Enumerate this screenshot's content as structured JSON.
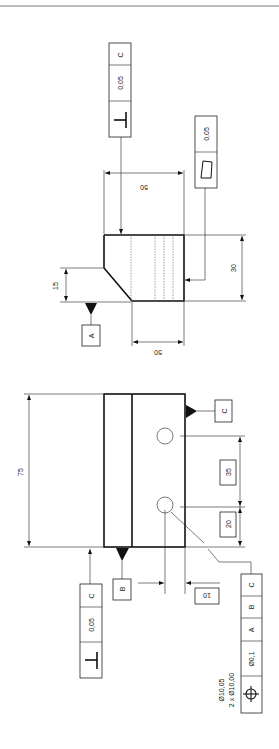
{
  "drawing": {
    "type": "engineering-drawing-gdt",
    "orientation": "rotated-90",
    "top_view": {
      "dim_height": "50",
      "dim_width": "30",
      "dim_bottom": "50",
      "dim_chamfer": "15",
      "datum_a": "A",
      "fcf_perpendicularity": {
        "symbol": "⊥",
        "tolerance": "0,05",
        "datum": "C"
      },
      "fcf_flatness": {
        "symbol": "▱",
        "tolerance": "0,05"
      }
    },
    "front_view": {
      "dim_length": "75",
      "dim_hole_spacing": "35",
      "dim_hole_edge": "20",
      "dim_hole_offset": "10",
      "datum_b": "B",
      "datum_c": "C",
      "fcf_perpendicularity": {
        "symbol": "⊥",
        "tolerance": "0,05",
        "datum": "C"
      },
      "fcf_position": {
        "symbol": "⌖",
        "tolerance": "Ø0,1",
        "datums": [
          "A",
          "B",
          "C"
        ],
        "note_line1": "Ø10,05",
        "note_line2": "2 x Ø10,00"
      }
    }
  }
}
